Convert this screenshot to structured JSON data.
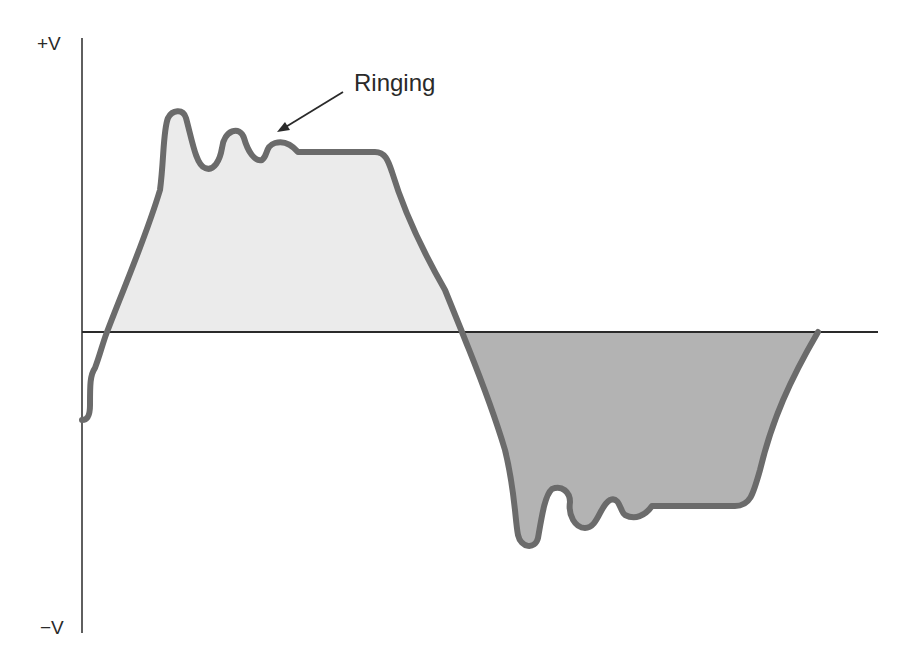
{
  "figure": {
    "type": "waveform-diagram",
    "y_axis": {
      "top_label": "+V",
      "bottom_label": "−V"
    },
    "annotation": {
      "text": "Ringing",
      "points_to": "ringing oscillations on positive pulse top"
    },
    "colors": {
      "axis": "#2a2a2a",
      "waveform_stroke": "#6b6b6b",
      "positive_fill": "#ebebeb",
      "negative_fill": "#b3b3b3",
      "text": "#2a2a2a"
    },
    "regions": [
      {
        "name": "positive-half-cycle",
        "fill": "light gray"
      },
      {
        "name": "negative-half-cycle",
        "fill": "medium gray"
      }
    ]
  }
}
